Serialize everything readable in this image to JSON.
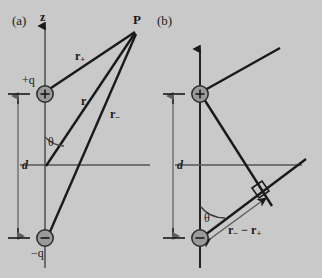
{
  "figure": {
    "background_color": "#c9c9c9",
    "ink_color": "#1a1a1a",
    "charge_fill_color": "#9a9a9a",
    "dimension_line_color": "#6e6e6e",
    "width": 322,
    "height": 278
  },
  "panel_a": {
    "tag": "(a)",
    "axis_label": "z",
    "positive_charge_label": "+q",
    "negative_charge_label": "−q",
    "separation_label": "d",
    "angle_label": "θ",
    "field_point_label": "P",
    "vector_r_plus": "r",
    "vector_r_plus_sub": "+",
    "vector_r": "r",
    "vector_r_minus": "r",
    "vector_r_minus_sub": "−"
  },
  "panel_b": {
    "tag": "(b)",
    "separation_label": "d",
    "angle_label": "θ",
    "path_difference_label": "r",
    "path_difference_sub1": "−",
    "path_difference_minus": " − ",
    "path_difference_label2": "r",
    "path_difference_sub2": "+"
  },
  "geometry": {
    "panel_a": {
      "z_axis": {
        "x": 45,
        "y_top": 22,
        "y_bottom": 268
      },
      "positive_charge": {
        "cx": 45,
        "cy": 94,
        "r": 8
      },
      "negative_charge": {
        "cx": 45,
        "cy": 238,
        "r": 8
      },
      "field_point": {
        "x": 137,
        "y": 30
      },
      "horizontal_axis": {
        "y": 165,
        "x_left": 20,
        "x_right": 148
      },
      "dimension_x": 18,
      "dimension_top": 94,
      "dimension_bottom": 238
    },
    "panel_b": {
      "z_axis": {
        "x": 200,
        "y_top": 45,
        "y_bottom": 268
      },
      "positive_charge": {
        "cx": 200,
        "cy": 94,
        "r": 8
      },
      "negative_charge": {
        "cx": 200,
        "cy": 238,
        "r": 8
      },
      "horizontal_axis": {
        "y": 165,
        "x_left": 175,
        "x_right": 302
      },
      "dimension_x": 173,
      "right_angle_marker": {
        "x": 262,
        "y": 196
      }
    }
  }
}
